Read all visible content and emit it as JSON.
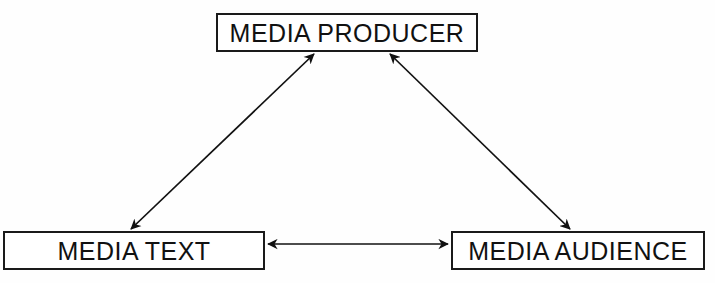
{
  "diagram": {
    "background_color": "#fefefe",
    "line_color": "#1a1a1a",
    "text_color": "#111111",
    "width": 715,
    "height": 283,
    "nodes": [
      {
        "id": "producer",
        "label": "MEDIA PRODUCER",
        "x": 216,
        "y": 13,
        "width": 262,
        "height": 39
      },
      {
        "id": "text",
        "label": "MEDIA TEXT",
        "x": 3,
        "y": 231,
        "width": 262,
        "height": 39
      },
      {
        "id": "audience",
        "label": "MEDIA AUDIENCE",
        "x": 451,
        "y": 231,
        "width": 254,
        "height": 39
      }
    ],
    "connectors": [
      {
        "id": "text-producer",
        "from": "text",
        "to": "producer",
        "style": "double-headed-arrow",
        "x1": 131,
        "y1": 229,
        "x2": 314,
        "y2": 54
      },
      {
        "id": "producer-audience",
        "from": "producer",
        "to": "audience",
        "style": "double-headed-arrow",
        "x1": 390,
        "y1": 54,
        "x2": 570,
        "y2": 229
      },
      {
        "id": "text-audience",
        "from": "text",
        "to": "audience",
        "style": "double-headed-arrow",
        "x1": 268,
        "y1": 244,
        "x2": 448,
        "y2": 244
      }
    ]
  }
}
